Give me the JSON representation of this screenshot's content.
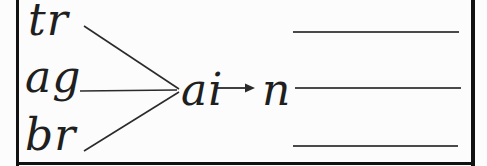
{
  "phonics": {
    "onsets": [
      "tr",
      "ag",
      "br"
    ],
    "medial": "ai",
    "final": "n",
    "answer_line_count": 3
  },
  "icons": {
    "arrow": "arrow-right-icon",
    "merge": "merge-lines"
  },
  "colors": {
    "ink": "#1f1f1f",
    "merge_line": "#2b2b2b",
    "answer_line": "#4a4a4a",
    "border": "#111111",
    "background": "#fcfcfc"
  }
}
